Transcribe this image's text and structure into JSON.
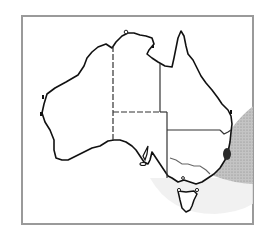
{
  "map": {
    "subject": "Australia distribution map",
    "colors": {
      "background": "#ffffff",
      "frame": "#9a9a9a",
      "coastline": "#111111",
      "state_border": "#333333",
      "river": "#666666",
      "range_shading": "#b8b8b8",
      "range_faint": "#e6e6e6",
      "occurrence_spot": "#2a2a2a"
    },
    "regions": [
      {
        "name": "Western Australia"
      },
      {
        "name": "Northern Territory"
      },
      {
        "name": "South Australia"
      },
      {
        "name": "Queensland"
      },
      {
        "name": "New South Wales"
      },
      {
        "name": "Victoria"
      },
      {
        "name": "Tasmania"
      }
    ],
    "features": {
      "range": "Shaded offshore range off east coast",
      "occurrence": "Dark spot near NSW mid-north coast"
    }
  }
}
